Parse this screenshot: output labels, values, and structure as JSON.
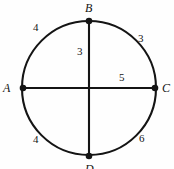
{
  "figure": {
    "kind": "circle-with-two-diameters",
    "background_color": "#fefefe",
    "stroke_color": "#141414",
    "circle": {
      "center_x": 89,
      "center_y": 88,
      "radius": 67,
      "stroke_width": 2.1
    },
    "points": [
      {
        "id": "A",
        "label": "A",
        "x": 23,
        "y": 88,
        "dot_radius": 3.2
      },
      {
        "id": "B",
        "label": "B",
        "x": 89,
        "y": 21,
        "dot_radius": 3.2
      },
      {
        "id": "C",
        "label": "C",
        "x": 155,
        "y": 88,
        "dot_radius": 3.2
      },
      {
        "id": "D",
        "label": "D",
        "x": 89,
        "y": 156,
        "dot_radius": 3.2
      }
    ],
    "segments": [
      {
        "id": "diameter-AC",
        "x1": 23,
        "y1": 88,
        "x2": 155,
        "y2": 88
      },
      {
        "id": "diameter-BD",
        "x1": 89,
        "y1": 21,
        "x2": 89,
        "y2": 156
      }
    ],
    "arc_labels": {
      "top_left": "4",
      "top_right": "3",
      "bottom_left": "4",
      "bottom_right": "6"
    },
    "chord_labels": {
      "vertical_upper": "3",
      "horizontal_right": "5"
    }
  }
}
